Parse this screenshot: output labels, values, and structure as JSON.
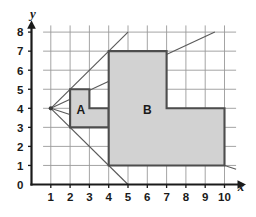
{
  "figure": {
    "background_color": "#ffffff"
  },
  "axes": {
    "x_axis_label": "x",
    "y_axis_label": "y",
    "x_ticks": [
      "1",
      "2",
      "3",
      "4",
      "5",
      "6",
      "7",
      "8",
      "9",
      "10"
    ],
    "y_ticks": [
      "0",
      "1",
      "2",
      "3",
      "4",
      "5",
      "6",
      "7",
      "8"
    ],
    "origin_label": "0",
    "axis_color": "#1a1a1a",
    "grid_color": "#9a9a9a",
    "grid_on": true
  },
  "chart_data": {
    "type": "diagram",
    "xlabel": "x",
    "ylabel": "y",
    "xlim": [
      0,
      10.8
    ],
    "ylim": [
      0,
      8.4
    ],
    "x_ticks": [
      1,
      2,
      3,
      4,
      5,
      6,
      7,
      8,
      9,
      10
    ],
    "y_ticks": [
      0,
      1,
      2,
      3,
      4,
      5,
      6,
      7,
      8
    ],
    "grid": true,
    "center_of_enlargement": {
      "label": "center",
      "x": 1,
      "y": 4
    },
    "scale_factor": 3,
    "shapes": [
      {
        "name": "A",
        "label": "A",
        "label_position": {
          "x": 2.55,
          "y": 3.68
        },
        "fill": "#d2d2d2",
        "stroke": "#4d4d4d",
        "vertices": [
          {
            "x": 2,
            "y": 3
          },
          {
            "x": 2,
            "y": 5
          },
          {
            "x": 3,
            "y": 5
          },
          {
            "x": 3,
            "y": 4
          },
          {
            "x": 4,
            "y": 4
          },
          {
            "x": 4,
            "y": 3
          }
        ]
      },
      {
        "name": "B",
        "label": "B",
        "label_position": {
          "x": 6.0,
          "y": 3.72
        },
        "fill": "#d2d2d2",
        "stroke": "#4d4d4d",
        "vertices": [
          {
            "x": 4,
            "y": 1
          },
          {
            "x": 4,
            "y": 7
          },
          {
            "x": 7,
            "y": 7
          },
          {
            "x": 7,
            "y": 4
          },
          {
            "x": 10,
            "y": 4
          },
          {
            "x": 10,
            "y": 1
          }
        ]
      }
    ],
    "rays": [
      {
        "from": {
          "x": 1,
          "y": 4
        },
        "to": {
          "x": 5.0,
          "y": 0.0
        }
      },
      {
        "from": {
          "x": 1,
          "y": 4
        },
        "to": {
          "x": 5.0,
          "y": 8.0
        }
      },
      {
        "from": {
          "x": 1,
          "y": 4
        },
        "to": {
          "x": 9.5,
          "y": 8.0
        }
      },
      {
        "from": {
          "x": 1,
          "y": 4
        },
        "to": {
          "x": 10.6,
          "y": 0.8
        }
      }
    ]
  },
  "labels": {
    "shape_a": "A",
    "shape_b": "B"
  },
  "colors": {
    "shape_fill": "#d2d2d2",
    "shape_stroke": "#4d4d4d",
    "ray_stroke": "#5a5a5a",
    "grid": "#9a9a9a",
    "axis": "#1a1a1a"
  }
}
